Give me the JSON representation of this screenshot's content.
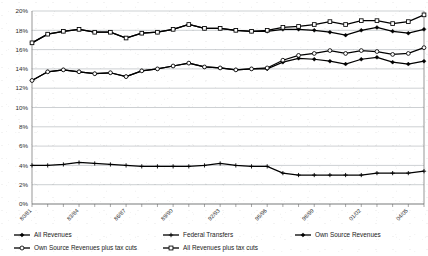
{
  "chart_data": {
    "type": "line",
    "title": "",
    "xlabel": "",
    "ylabel": "",
    "ylim": [
      0,
      20
    ],
    "ytick_labels": [
      "0%",
      "2%",
      "4%",
      "6%",
      "8%",
      "10%",
      "12%",
      "14%",
      "16%",
      "18%",
      "20%"
    ],
    "ytick_values": [
      0,
      2,
      4,
      6,
      8,
      10,
      12,
      14,
      16,
      18,
      20
    ],
    "grid": true,
    "legend_position": "bottom",
    "x": [
      "80/81",
      "81/82",
      "82/83",
      "83/84",
      "84/85",
      "85/86",
      "86/87",
      "87/88",
      "88/89",
      "89/90",
      "90/91",
      "91/92",
      "92/93",
      "93/94",
      "94/95",
      "95/96",
      "96/97",
      "97/98",
      "98/99",
      "99/00",
      "00/01",
      "01/02",
      "02/03",
      "03/04",
      "04/05",
      "05/06"
    ],
    "xtick_labels": [
      "80/81",
      "83/84",
      "86/87",
      "89/90",
      "92/93",
      "95/96",
      "98/99",
      "01/02",
      "04/05"
    ],
    "xtick_indices": [
      0,
      3,
      6,
      9,
      12,
      15,
      18,
      21,
      24
    ],
    "series": [
      {
        "name": "All Revenues",
        "marker": "diamond-filled",
        "color": "#000000",
        "values": [
          16.7,
          17.6,
          17.9,
          18.1,
          17.8,
          17.8,
          17.2,
          17.7,
          17.8,
          18.1,
          18.6,
          18.2,
          18.2,
          18.0,
          17.9,
          17.9,
          18.1,
          18.1,
          18.0,
          17.8,
          17.5,
          18.0,
          18.3,
          17.9,
          17.7,
          18.1
        ]
      },
      {
        "name": "Federal Transfers",
        "marker": "plus",
        "color": "#000000",
        "values": [
          4.0,
          4.0,
          4.1,
          4.3,
          4.2,
          4.1,
          4.0,
          3.9,
          3.9,
          3.9,
          3.9,
          4.0,
          4.2,
          4.0,
          3.9,
          3.9,
          3.2,
          3.0,
          3.0,
          3.0,
          3.0,
          3.0,
          3.2,
          3.2,
          3.2,
          3.4
        ]
      },
      {
        "name": "Own Source Revenues",
        "marker": "diamond-filled",
        "color": "#000000",
        "values": [
          12.8,
          13.7,
          13.9,
          13.7,
          13.5,
          13.6,
          13.2,
          13.8,
          14.0,
          14.3,
          14.6,
          14.2,
          14.1,
          13.9,
          14.0,
          14.0,
          14.7,
          15.1,
          15.0,
          14.8,
          14.5,
          15.0,
          15.2,
          14.7,
          14.5,
          14.8
        ]
      },
      {
        "name": "Own Source Revenues plus tax cuts",
        "marker": "circle-open",
        "color": "#000000",
        "values": [
          12.8,
          13.7,
          13.9,
          13.7,
          13.5,
          13.6,
          13.2,
          13.8,
          14.0,
          14.3,
          14.6,
          14.2,
          14.1,
          13.9,
          14.0,
          14.1,
          14.9,
          15.4,
          15.6,
          15.9,
          15.6,
          15.9,
          15.8,
          15.5,
          15.6,
          16.2
        ]
      },
      {
        "name": "All Revenues plus tax cuts",
        "marker": "square-open",
        "color": "#000000",
        "values": [
          16.7,
          17.6,
          17.9,
          18.1,
          17.8,
          17.8,
          17.2,
          17.7,
          17.8,
          18.1,
          18.6,
          18.2,
          18.2,
          18.0,
          17.9,
          18.0,
          18.3,
          18.4,
          18.6,
          18.9,
          18.6,
          19.0,
          19.0,
          18.7,
          18.9,
          19.6
        ]
      }
    ]
  },
  "legend": {
    "items": [
      {
        "label": "All Revenues",
        "marker": "diamond-filled"
      },
      {
        "label": "Federal Transfers",
        "marker": "plus"
      },
      {
        "label": "Own Source Revenues",
        "marker": "diamond-filled"
      },
      {
        "label": "Own Source Revenues plus tax cuts",
        "marker": "circle-open"
      },
      {
        "label": "All Revenues plus tax cuts",
        "marker": "square-open"
      }
    ]
  },
  "colors": {
    "line": "#000000",
    "grid": "#9aa0a6",
    "axis": "#6b6b6b",
    "text": "#1a1a1a",
    "background": "#ffffff"
  }
}
